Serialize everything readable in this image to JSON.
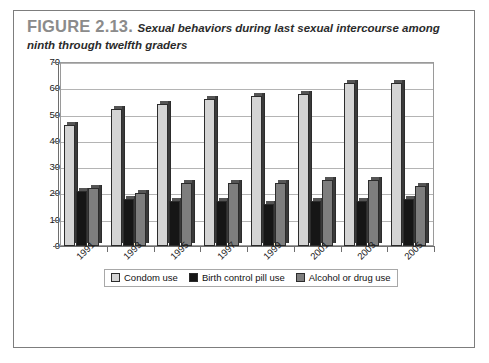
{
  "figure": {
    "label": "FIGURE 2.13.",
    "title": "Sexual behaviors during last sexual intercourse among ninth through twelfth graders"
  },
  "colors": {
    "series_condom": "#d4d4d4",
    "series_pill": "#161616",
    "series_alcohol": "#7e7e7e",
    "frame_border": "#7d7d7d",
    "gridline": "#b4b4b4",
    "axis": "#6e6e6e",
    "label_gray": "#8b8b8b"
  },
  "legend": {
    "items": [
      {
        "label": "Condom use",
        "color": "#d4d4d4"
      },
      {
        "label": "Birth control pill use",
        "color": "#161616"
      },
      {
        "label": "Alcohol or drug use",
        "color": "#7e7e7e"
      }
    ]
  },
  "axes": {
    "y_ticks": [
      "0",
      "10",
      "20",
      "30",
      "40",
      "50",
      "60",
      "70"
    ],
    "x_ticks": [
      "1991",
      "1993",
      "1995",
      "1997",
      "1999",
      "2001",
      "2003",
      "2005"
    ]
  },
  "chart_data": {
    "type": "bar",
    "title": "Sexual behaviors during last sexual intercourse among ninth through twelfth graders",
    "xlabel": "",
    "ylabel": "",
    "ylim": [
      0,
      70
    ],
    "ytick_step": 10,
    "grid": true,
    "legend_position": "bottom",
    "categories": [
      "1991",
      "1993",
      "1995",
      "1997",
      "1999",
      "2001",
      "2003",
      "2005"
    ],
    "series": [
      {
        "name": "Condom use",
        "color": "#d4d4d4",
        "values": [
          46,
          52,
          54,
          56,
          57,
          58,
          62,
          62
        ]
      },
      {
        "name": "Birth control pill use",
        "color": "#161616",
        "values": [
          21,
          18,
          17,
          17,
          16,
          17,
          17,
          18
        ]
      },
      {
        "name": "Alcohol or drug use",
        "color": "#7e7e7e",
        "values": [
          22,
          20,
          24,
          24,
          24,
          25,
          25,
          23
        ]
      }
    ]
  }
}
